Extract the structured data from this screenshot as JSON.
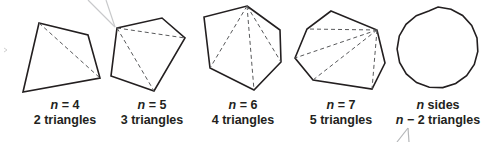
{
  "diagram": {
    "stroke_color": "#231f20",
    "diagonal_color": "#58595b",
    "callout_color": "#bcbec0",
    "figures": [
      {
        "id": "quadrilateral",
        "var": "n",
        "eq": "= 4",
        "line2": "2 triangles",
        "sides": 4,
        "triangles": 2
      },
      {
        "id": "pentagon",
        "var": "n",
        "eq": "= 5",
        "line2": "3 triangles",
        "sides": 5,
        "triangles": 3
      },
      {
        "id": "hexagon",
        "var": "n",
        "eq": "= 6",
        "line2": "4 triangles",
        "sides": 6,
        "triangles": 4
      },
      {
        "id": "heptagon",
        "var": "n",
        "eq": "= 7",
        "line2": "5 triangles",
        "sides": 7,
        "triangles": 5
      },
      {
        "id": "n-gon",
        "var": "n",
        "eq": "sides",
        "line2_var": "n",
        "line2": "− 2 triangles",
        "sides": "n",
        "triangles": "n − 2"
      }
    ]
  }
}
